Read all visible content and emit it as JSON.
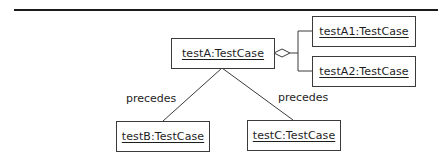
{
  "diagram": {
    "type": "UML object diagram",
    "objects": [
      {
        "id": "testA",
        "label": "testA:TestCase"
      },
      {
        "id": "testA1",
        "label": "testA1:TestCase"
      },
      {
        "id": "testA2",
        "label": "testA2:TestCase"
      },
      {
        "id": "testB",
        "label": "testB:TestCase"
      },
      {
        "id": "testC",
        "label": "testC:TestCase"
      }
    ],
    "links": [
      {
        "from": "testA",
        "to": "testA1",
        "kind": "aggregation"
      },
      {
        "from": "testA",
        "to": "testA2",
        "kind": "aggregation"
      },
      {
        "from": "testA",
        "to": "testB",
        "kind": "association",
        "label": "precedes"
      },
      {
        "from": "testA",
        "to": "testC",
        "kind": "association",
        "label": "precedes"
      }
    ],
    "link_labels": {
      "left": "precedes",
      "right": "precedes"
    },
    "colors": {
      "line": "#3a3a3a",
      "text": "#1e1e1e",
      "background": "#ffffff"
    }
  }
}
